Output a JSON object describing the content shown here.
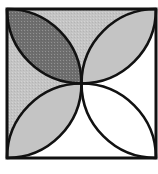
{
  "figure": {
    "square": {
      "x": 7,
      "y": 9,
      "size": 149
    },
    "colors": {
      "stroke": "#111111",
      "dark_shade": "#6e6e6e",
      "light_shade": "#c4c4c4",
      "white": "#ffffff"
    },
    "petals": [
      {
        "position": "top-left",
        "fill": "dark"
      },
      {
        "position": "top-right",
        "fill": "light"
      },
      {
        "position": "bottom-left",
        "fill": "light"
      },
      {
        "position": "bottom-right",
        "fill": "white"
      }
    ],
    "gaps": [
      {
        "position": "top",
        "fill": "light"
      },
      {
        "position": "left",
        "fill": "light"
      },
      {
        "position": "right",
        "fill": "white"
      },
      {
        "position": "bottom",
        "fill": "white"
      }
    ]
  }
}
